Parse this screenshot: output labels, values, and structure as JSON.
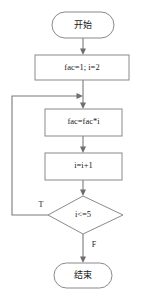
{
  "diagram": {
    "type": "flowchart",
    "nodes": {
      "start": {
        "label": "开始",
        "shape": "terminator"
      },
      "init": {
        "label": "fac=1; i=2",
        "shape": "process"
      },
      "multiply": {
        "label": "fac=fac*i",
        "shape": "process"
      },
      "increment": {
        "label": "i=i+1",
        "shape": "process"
      },
      "decision": {
        "label": "i<=5",
        "shape": "diamond"
      },
      "end": {
        "label": "结束",
        "shape": "terminator"
      }
    },
    "branches": {
      "true_label": "T",
      "false_label": "F"
    },
    "colors": {
      "stroke": "#8a8a8a",
      "connector": "#7a7a7a",
      "text": "#1a1a1a",
      "background": "#ffffff"
    }
  }
}
